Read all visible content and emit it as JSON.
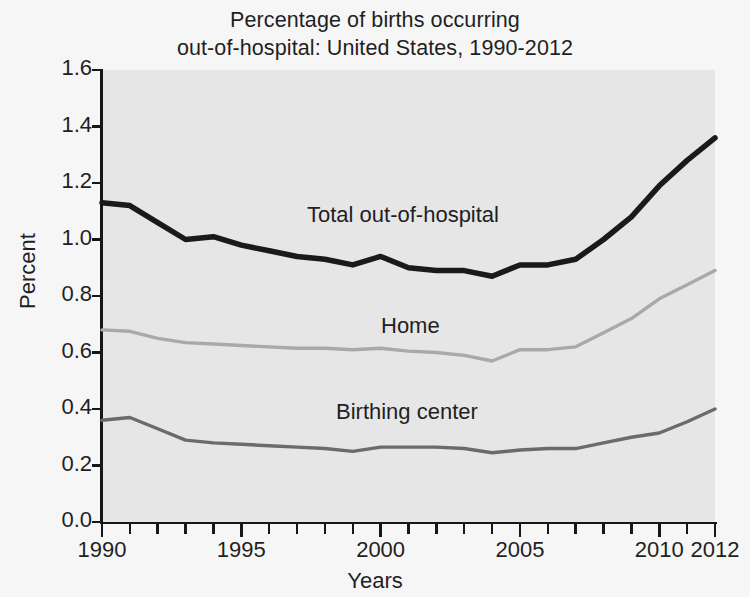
{
  "chart_data": {
    "type": "line",
    "title": "Percentage of births occurring\nout-of-hospital: United States, 1990-2012",
    "xlabel": "Years",
    "ylabel": "Percent",
    "xlim": [
      1990,
      2012
    ],
    "ylim": [
      0.0,
      1.6
    ],
    "grid": false,
    "legend_position": "inline-annotations",
    "x": [
      1990,
      1991,
      1992,
      1993,
      1994,
      1995,
      1996,
      1997,
      1998,
      1999,
      2000,
      2001,
      2002,
      2003,
      2004,
      2005,
      2006,
      2007,
      2008,
      2009,
      2010,
      2011,
      2012
    ],
    "xtick_labels": [
      "1990",
      "1995",
      "2000",
      "2005",
      "2010",
      "2012"
    ],
    "xtick_values": [
      1990,
      1995,
      2000,
      2005,
      2010,
      2012
    ],
    "ytick_labels": [
      "0.0",
      "0.2",
      "0.4",
      "0.6",
      "0.8",
      "1.0",
      "1.2",
      "1.4",
      "1.6"
    ],
    "ytick_values": [
      0.0,
      0.2,
      0.4,
      0.6,
      0.8,
      1.0,
      1.2,
      1.4,
      1.6
    ],
    "series": [
      {
        "name": "Total out-of-hospital",
        "color": "#1a1a1a",
        "values": [
          1.13,
          1.12,
          1.06,
          1.0,
          1.01,
          0.98,
          0.96,
          0.94,
          0.93,
          0.91,
          0.94,
          0.9,
          0.89,
          0.89,
          0.87,
          0.91,
          0.91,
          0.93,
          1.0,
          1.08,
          1.19,
          1.28,
          1.36
        ]
      },
      {
        "name": "Home",
        "color": "#a9a9a9",
        "values": [
          0.68,
          0.675,
          0.65,
          0.635,
          0.63,
          0.625,
          0.62,
          0.615,
          0.615,
          0.61,
          0.615,
          0.605,
          0.6,
          0.59,
          0.57,
          0.61,
          0.61,
          0.62,
          0.67,
          0.72,
          0.79,
          0.84,
          0.89
        ]
      },
      {
        "name": "Birthing center",
        "color": "#6b6b6b",
        "values": [
          0.36,
          0.37,
          0.33,
          0.29,
          0.28,
          0.275,
          0.27,
          0.265,
          0.26,
          0.25,
          0.265,
          0.265,
          0.265,
          0.26,
          0.245,
          0.255,
          0.26,
          0.26,
          0.28,
          0.3,
          0.315,
          0.355,
          0.4
        ]
      }
    ]
  },
  "labels": {
    "series_total": "Total out-of-hospital",
    "series_home": "Home",
    "series_birthing_center": "Birthing center"
  }
}
